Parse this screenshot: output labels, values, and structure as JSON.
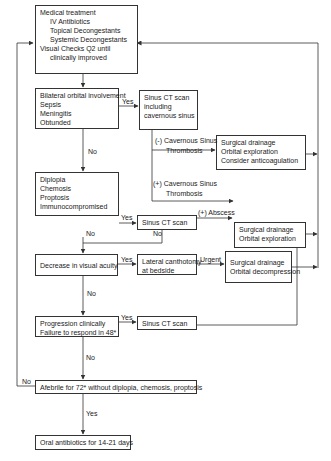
{
  "diagram": {
    "type": "clinical-management-flowchart",
    "nodes": {
      "medical_treatment": {
        "lines": [
          "Medical treatment",
          "IV Antibiotics",
          "Topical Decongestants",
          "Systemic Decongestants",
          "Visual Checks Q2 until",
          "clinically improved"
        ]
      },
      "bilateral": {
        "lines": [
          "Bilateral orbital involvement",
          "Sepsis",
          "Meningitis",
          "Obtunded"
        ]
      },
      "sinus_ct_cavernous": {
        "lines": [
          "Sinus CT scan",
          "including",
          "cavernous sinus"
        ]
      },
      "surgical_anticoag": {
        "lines": [
          "Surgical drainage",
          "Orbital exploration",
          "Consider anticoagulation"
        ]
      },
      "diplopia": {
        "lines": [
          "Diplopia",
          "Chemosis",
          "Proptosis",
          "Immunocompromised"
        ]
      },
      "sinus_ct_2": {
        "lines": [
          "Sinus CT scan"
        ]
      },
      "surgical_exploration": {
        "lines": [
          "Surgical drainage",
          "Orbital exploration"
        ]
      },
      "visual_acuity": {
        "lines": [
          "Decrease in visual acuity"
        ]
      },
      "canthotomy": {
        "lines": [
          "Lateral canthotomy",
          "at bedside"
        ]
      },
      "surgical_decompression": {
        "lines": [
          "Surgical drainage",
          "Orbital decompression"
        ]
      },
      "progression": {
        "lines": [
          "Progression clinically",
          "Failure to respond in 48*"
        ]
      },
      "sinus_ct_3": {
        "lines": [
          "Sinus CT scan"
        ]
      },
      "afebrile": {
        "lines": [
          "Afebrile for 72* without diplopia, chemosis, proptosis"
        ]
      },
      "oral_antibiotics": {
        "lines": [
          "Oral antibiotics for 14-21 days"
        ]
      }
    },
    "edge_labels": {
      "bilateral_yes": "Yes",
      "bilateral_no": "No",
      "neg_cst_1": "(-) Cavernous Sinus",
      "neg_cst_2": "Thrombosis",
      "pos_cst_1": "(+) Cavernous Sinus",
      "pos_cst_2": "Thrombosis",
      "diplopia_yes": "Yes",
      "abscess": "(+) Abscess",
      "ct2_no": "No",
      "diplopia_no": "No",
      "acuity_yes": "Yes",
      "urgent": "Urgent",
      "acuity_no": "No",
      "progression_yes": "Yes",
      "progression_no": "No",
      "afebrile_no": "No",
      "afebrile_yes": "Yes"
    }
  }
}
